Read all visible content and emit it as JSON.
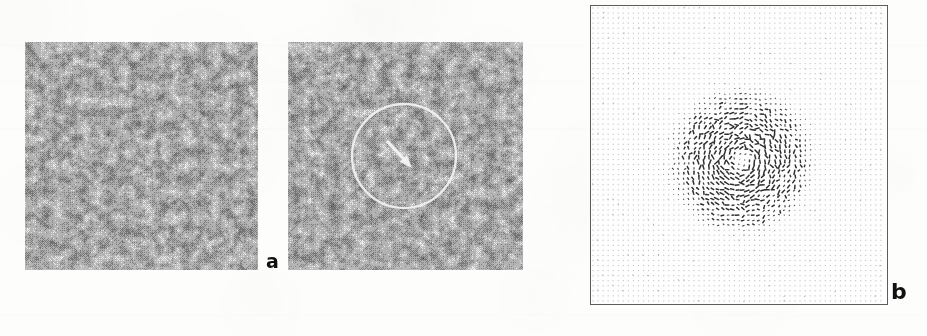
{
  "figure": {
    "width": 927,
    "height": 336,
    "background_color": "#fdfdfc",
    "caption_labels": {
      "panel_a": "a",
      "panel_b": "b"
    }
  },
  "panels": [
    {
      "id": "micrograph-left",
      "label": "",
      "type": "halftone-micrograph",
      "x": 25,
      "y": 42,
      "width": 233,
      "height": 228,
      "description": "speckled halftone grayscale texture",
      "tone_min": "#4a4a4a",
      "tone_max": "#ededed",
      "annotations": []
    },
    {
      "id": "micrograph-right",
      "label": "a",
      "type": "halftone-micrograph",
      "x": 288,
      "y": 42,
      "width": 235,
      "height": 228,
      "description": "speckled halftone grayscale texture with circled region and arrow",
      "tone_min": "#4a4a4a",
      "tone_max": "#ededed",
      "annotations": [
        {
          "kind": "circle",
          "name": "region-of-interest-circle",
          "color": "#f2f2f2",
          "center_x": 116,
          "center_y": 114,
          "radius": 52,
          "stroke_width": 2.4
        },
        {
          "kind": "arrow",
          "name": "feature-pointer-arrow",
          "color": "#f4f4f4",
          "x1": 100,
          "y1": 100,
          "x2": 124,
          "y2": 126,
          "stroke_width": 3.2,
          "head_length": 13,
          "head_width": 10
        }
      ]
    },
    {
      "id": "vector-field",
      "label": "b",
      "type": "vector-field",
      "x": 590,
      "y": 5,
      "width": 298,
      "height": 300,
      "border_color": "#5c5c5c",
      "grid": {
        "pitch": 5.05,
        "dot_color": "#c9c9c9",
        "background_dot_size": 1.2
      },
      "vortex": {
        "center_x": 150,
        "center_y": 155,
        "radius": 66,
        "core_radius": 14,
        "vector_color": "#3a3a3a",
        "max_vector_length": 4.6,
        "circulation": "counter-clockwise"
      }
    }
  ],
  "labels": [
    {
      "name": "panel-label-a",
      "text": "a",
      "x": 266,
      "y": 252,
      "font_size": 19
    },
    {
      "name": "panel-label-b",
      "text": "b",
      "x": 891,
      "y": 281,
      "font_size": 22
    }
  ],
  "chart_data": {
    "type": "scatter",
    "title": "",
    "subtitle": "",
    "xlabel": "",
    "ylabel": "",
    "grid": true,
    "legend_position": "none",
    "panels": [
      {
        "key": "a",
        "name": "halftone micrograph pair",
        "type": "image",
        "count": 2,
        "annotation_shapes": [
          "circle",
          "arrow"
        ]
      },
      {
        "key": "b",
        "name": "displacement vector field",
        "type": "quiver",
        "grid_nx": 59,
        "grid_ny": 59,
        "vortex_center": [
          150,
          155
        ],
        "vortex_radius": 66,
        "background_vector_magnitude": 0.15,
        "peak_vector_magnitude": 1.0
      }
    ]
  }
}
